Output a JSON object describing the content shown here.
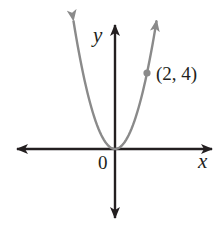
{
  "chart_data": {
    "type": "line",
    "title": "",
    "function": "y = x^2",
    "xlabel": "x",
    "ylabel": "y",
    "origin_label": "0",
    "series": [
      {
        "name": "y = x^2",
        "color": "#8a8a8a",
        "x": [
          -2.6,
          -2,
          -1.5,
          -1,
          -0.5,
          0,
          0.5,
          1,
          1.5,
          2,
          2.6
        ],
        "y": [
          6.76,
          4,
          2.25,
          1,
          0.25,
          0,
          0.25,
          1,
          2.25,
          4,
          6.76
        ]
      }
    ],
    "annotations": [
      {
        "point": [
          2,
          4
        ],
        "label": "(2, 4)",
        "marker": "dot"
      }
    ],
    "grid": false,
    "tick_labels": [],
    "axis_color": "#231f20",
    "curve_color": "#8a8a8a"
  },
  "labels": {
    "x_axis": "x",
    "y_axis": "y",
    "origin": "0",
    "point": "(2, 4)"
  }
}
